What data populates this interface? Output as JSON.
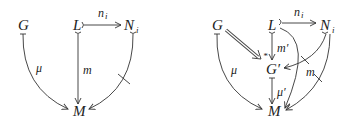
{
  "diagrams": [
    {
      "id": "left",
      "nodes": {
        "G": {
          "label": "G"
        },
        "L": {
          "label": "L"
        },
        "N": {
          "label": "N",
          "sub": "i"
        },
        "M": {
          "label": "M"
        }
      },
      "edges": {
        "n": {
          "from": "L",
          "to": "N",
          "label": "n",
          "sub": "i",
          "style": "mono"
        },
        "mu": {
          "from": "G",
          "to": "M",
          "label": "μ",
          "style": "tail-bar curved"
        },
        "m": {
          "from": "L",
          "to": "M",
          "label": "m",
          "style": "mono"
        },
        "nm": {
          "from": "N",
          "to": "M",
          "label": "",
          "style": "mono curved crossed"
        }
      }
    },
    {
      "id": "right",
      "nodes": {
        "G": {
          "label": "G"
        },
        "L": {
          "label": "L"
        },
        "N": {
          "label": "N",
          "sub": "i"
        },
        "Gp": {
          "label": "G′"
        },
        "M": {
          "label": "M"
        }
      },
      "edges": {
        "n": {
          "from": "L",
          "to": "N",
          "label": "n",
          "sub": "i",
          "style": "mono"
        },
        "dbl": {
          "from": "G",
          "to": "G′",
          "label": "",
          "style": "double (implication)",
          "marker": "*"
        },
        "mp": {
          "from": "L",
          "to": "G′",
          "label": "m′",
          "style": "mono"
        },
        "NGp": {
          "from": "N",
          "to": "G′",
          "label": "",
          "style": "mono curved crossed"
        },
        "mu": {
          "from": "G",
          "to": "M",
          "label": "μ",
          "style": "tail-bar curved"
        },
        "mup": {
          "from": "G′",
          "to": "M",
          "label": "μ′",
          "style": "tail-bar"
        },
        "LM": {
          "from": "L",
          "to": "M",
          "label": "m",
          "style": "mono curved"
        },
        "NM": {
          "from": "N",
          "to": "M",
          "label": "",
          "style": "mono curved crossed"
        }
      }
    }
  ],
  "glyphs": {
    "star": "*",
    "prime": "′"
  }
}
